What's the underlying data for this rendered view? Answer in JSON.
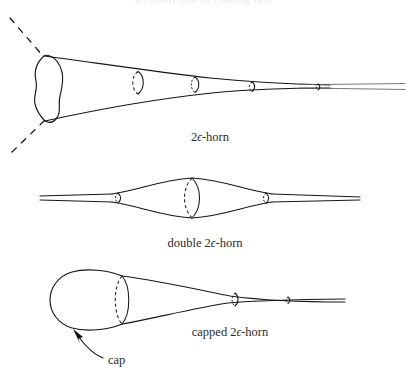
{
  "figure": {
    "background_color": "#ffffff",
    "ink_color": "#161616",
    "caption_color": "#2b2b2b",
    "width": 407,
    "height": 382,
    "top_cropped_line": "a cut-off line of running text",
    "panels": [
      {
        "id": "horn",
        "caption": "2ϵ-horn",
        "caption_prefix": "2",
        "caption_epsilon": "ϵ",
        "caption_suffix": "-horn",
        "caption_x": 210,
        "caption_y": 141,
        "description": "flaring trumpet with wavy open left boundary and dashed continuation lines",
        "cross_sections": 4
      },
      {
        "id": "double-horn",
        "caption": "double 2ϵ-horn",
        "caption_prefix": "double 2",
        "caption_epsilon": "ϵ",
        "caption_suffix": "-horn",
        "caption_x": 205,
        "caption_y": 247,
        "description": "symmetric spindle bulge between two thin tubes",
        "cross_sections": 3
      },
      {
        "id": "capped-horn",
        "caption": "capped 2ϵ-horn",
        "caption_prefix": "capped 2",
        "caption_epsilon": "ϵ",
        "caption_suffix": "-horn",
        "caption_x": 230,
        "caption_y": 336,
        "description": "rounded cap on left tapering into a thin tube",
        "cross_sections": 3
      }
    ],
    "annotations": [
      {
        "id": "cap",
        "label": "cap",
        "label_x": 108,
        "label_y": 364,
        "arrow_target_x": 73,
        "arrow_target_y": 330
      }
    ]
  }
}
